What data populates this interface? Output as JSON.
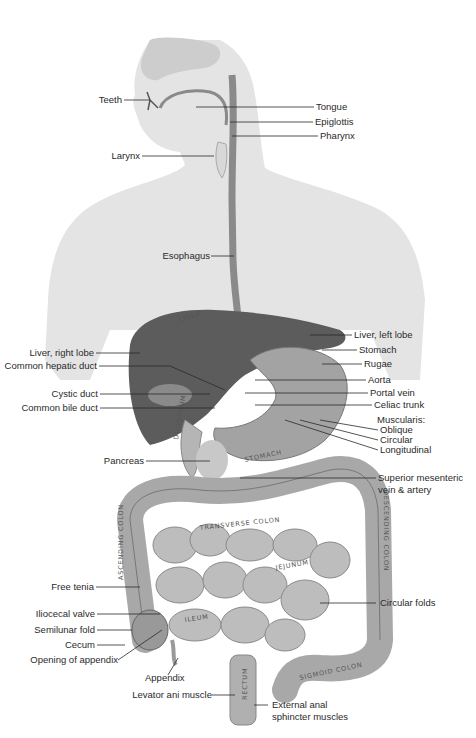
{
  "diagram": {
    "type": "anatomical-labeled-illustration",
    "colors": {
      "background": "#ffffff",
      "body_silhouette": "#e3e3e3",
      "head_detail": "#cfcfcf",
      "liver": "#5e5e5e",
      "stomach": "#9a9a9a",
      "intestine": "#b8b8b8",
      "intestine_shadow": "#8c8c8c",
      "esophagus": "#7a7a7a",
      "leader_line": "#2a2a2a",
      "label_text": "#2a2a2a"
    },
    "labels_left": [
      {
        "id": "teeth",
        "text": "Teeth"
      },
      {
        "id": "larynx",
        "text": "Larynx"
      },
      {
        "id": "esophagus",
        "text": "Esophagus"
      },
      {
        "id": "liver-right-lobe",
        "text": "Liver, right lobe"
      },
      {
        "id": "common-hepatic-duct",
        "text": "Common hepatic duct"
      },
      {
        "id": "cystic-duct",
        "text": "Cystic duct"
      },
      {
        "id": "common-bile-duct",
        "text": "Common bile duct"
      },
      {
        "id": "pancreas",
        "text": "Pancreas"
      },
      {
        "id": "free-tenia",
        "text": "Free tenia"
      },
      {
        "id": "iliocecal-valve",
        "text": "Iliocecal valve"
      },
      {
        "id": "semilunar-fold",
        "text": "Semilunar fold"
      },
      {
        "id": "cecum",
        "text": "Cecum"
      },
      {
        "id": "opening-of-appendix",
        "text": "Opening of appendix"
      },
      {
        "id": "appendix",
        "text": "Appendix"
      },
      {
        "id": "levator-ani-muscle",
        "text": "Levator ani muscle"
      }
    ],
    "labels_right": [
      {
        "id": "tongue",
        "text": "Tongue"
      },
      {
        "id": "epiglottis",
        "text": "Epiglottis"
      },
      {
        "id": "pharynx",
        "text": "Pharynx"
      },
      {
        "id": "liver-left-lobe",
        "text": "Liver, left lobe"
      },
      {
        "id": "stomach",
        "text": "Stomach"
      },
      {
        "id": "rugae",
        "text": "Rugae"
      },
      {
        "id": "aorta",
        "text": "Aorta"
      },
      {
        "id": "portal-vein",
        "text": "Portal vein"
      },
      {
        "id": "celiac-trunk",
        "text": "Celiac trunk"
      },
      {
        "id": "muscularis",
        "text": "Muscularis:"
      },
      {
        "id": "oblique",
        "text": "Oblique"
      },
      {
        "id": "circular",
        "text": "Circular"
      },
      {
        "id": "longitudinal",
        "text": "Longitudinal"
      },
      {
        "id": "superior-mesenteric-1",
        "text": "Superior mesenteric"
      },
      {
        "id": "superior-mesenteric-2",
        "text": "vein & artery"
      },
      {
        "id": "circular-folds",
        "text": "Circular folds"
      },
      {
        "id": "external-anal-1",
        "text": "External anal"
      },
      {
        "id": "external-anal-2",
        "text": "sphincter muscles"
      }
    ],
    "organ_inscriptions": {
      "liver": "LIVER",
      "gallbladder": "GALLBLADDER",
      "duodenum": "DUODENUM",
      "stomach": "STOMACH",
      "transverse_colon": "TRANSVERSE COLON",
      "ascending_colon": "ASCENDING COLON",
      "descending_colon": "DESCENDING COLON",
      "jejunum": "JEJUNUM",
      "ileum": "ILEUM",
      "mesentery": "MESENTERY",
      "rectum": "RECTUM",
      "sigmoid_colon": "SIGMOID COLON"
    }
  }
}
